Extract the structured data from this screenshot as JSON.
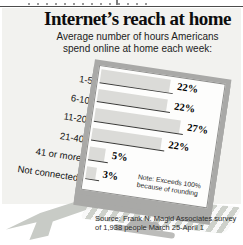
{
  "header": {
    "title": "Internet’s reach at home",
    "subtitle_line1": "Average number of hours Americans",
    "subtitle_line2": "spend online at home each week:"
  },
  "chart_data": {
    "type": "bar",
    "orientation": "horizontal",
    "categories": [
      "1-5",
      "6-10",
      "11-20",
      "21-40",
      "41 or more",
      "Not connected"
    ],
    "values": [
      22,
      22,
      27,
      22,
      5,
      3
    ],
    "value_labels": [
      "22%",
      "22%",
      "27%",
      "22%",
      "5%",
      "3%"
    ],
    "unit": "%",
    "xlim": [
      0,
      30
    ],
    "note": "Note: Exceeds 100% because of rounding",
    "legend": "none",
    "grid": "off"
  },
  "note": {
    "line1": "Note: Exceeds 100%",
    "line2": "because of rounding"
  },
  "source": {
    "line1": "Source: Frank N. Magid Associates survey",
    "line2": "of 1,938 people March 25-April 1"
  },
  "colors": {
    "panel_bg": "#f2f2ef",
    "bar_fill": "#dbdbd8",
    "bar_line": "#3a3a38",
    "monitor_bezel": "#a9a9a7",
    "screen_bg": "#fdfdfc",
    "ghost_shapes": "#d0d4ce",
    "text": "#0d0d0d"
  }
}
